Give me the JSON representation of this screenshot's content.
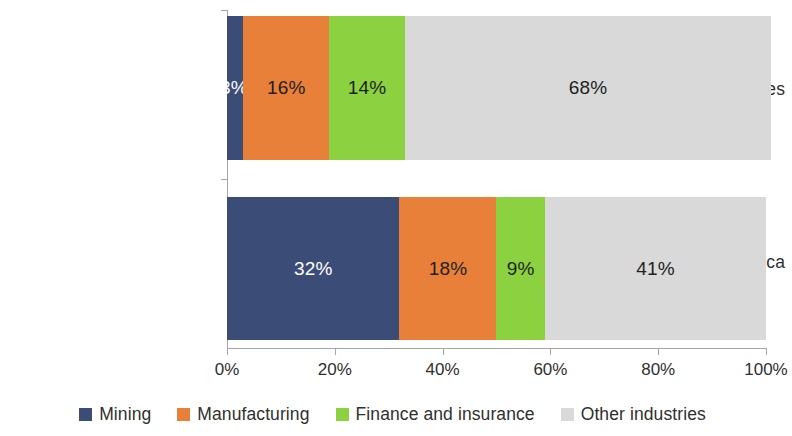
{
  "chart_data": {
    "type": "bar",
    "orientation": "horizontal",
    "stacked": true,
    "stack_mode": "percent",
    "title": "",
    "subtitle": "",
    "xlabel": "",
    "ylabel": "",
    "xlim": [
      0,
      100
    ],
    "grid": false,
    "legend_position": "bottom",
    "categories": [
      "US FDI in All countries",
      "US FDI in Africa"
    ],
    "tick_labels": [
      "0%",
      "20%",
      "40%",
      "60%",
      "80%",
      "100%"
    ],
    "tick_values": [
      0,
      20,
      40,
      60,
      80,
      100
    ],
    "series": [
      {
        "name": "Mining",
        "color": "#3B4D77",
        "label_color": "#ffffff",
        "values": [
          3,
          32
        ],
        "data_labels": [
          "3%",
          "32%"
        ]
      },
      {
        "name": "Manufacturing",
        "color": "#E8803A",
        "label_color": "#1f1f1f",
        "values": [
          16,
          18
        ],
        "data_labels": [
          "16%",
          "18%"
        ]
      },
      {
        "name": "Finance and insurance",
        "color": "#8CD13F",
        "label_color": "#1f1f1f",
        "values": [
          14,
          9
        ],
        "data_labels": [
          "14%",
          "9%"
        ]
      },
      {
        "name": "Other industries",
        "color": "#D9D9D9",
        "label_color": "#1f1f1f",
        "values": [
          68,
          41
        ],
        "data_labels": [
          "68%",
          "41%"
        ]
      }
    ]
  },
  "axis": {
    "line_color": "#a6a6a6"
  }
}
